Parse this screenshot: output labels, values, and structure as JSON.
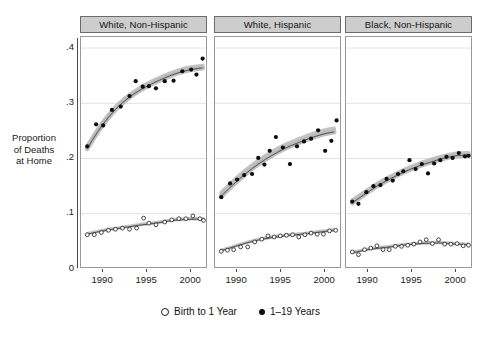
{
  "figure": {
    "ylabel_lines": [
      "Proportion",
      "of Deaths",
      "at Home"
    ],
    "band_color": "#b8b8b8",
    "fit_line_color": "#4d4d4d",
    "filled_marker_color": "#0d0d0d",
    "open_marker_color": "#1a1a1a",
    "gridline_color": "#d9d9d9",
    "strip_background": "#cdcdcd"
  },
  "legend": {
    "position": "bottom",
    "items": [
      {
        "glyph": "open-circle-icon",
        "label": "Birth to 1 Year"
      },
      {
        "glyph": "filled-circle-icon",
        "label": "1–19 Years"
      }
    ]
  },
  "chart_data": {
    "type": "scatter",
    "title": "",
    "subtitle": "",
    "xlabel": "",
    "ylabel": "Proportion of Deaths at Home",
    "xlim": [
      1987.6,
      2001.8
    ],
    "ylim": [
      0,
      0.42
    ],
    "grid": true,
    "yticks": [
      0,
      0.1,
      0.2,
      0.3,
      0.4
    ],
    "ytick_labels": [
      "0",
      ".1",
      ".2",
      ".3",
      ".4"
    ],
    "xticks": [
      1990,
      1995,
      2000
    ],
    "xtick_labels": [
      "1990",
      "1995",
      "2000"
    ],
    "panels": [
      {
        "label": "White, Non-Hispanic",
        "series": [
          {
            "name": "1–19 Years",
            "marker": "filled-circle",
            "x": [
              1988.2,
              1989.2,
              1990.0,
              1991.0,
              1992.0,
              1993.0,
              1993.7,
              1994.5,
              1995.2,
              1996.0,
              1997.0,
              1998.0,
              1999.0,
              2000.0,
              2000.6,
              2001.3
            ],
            "values": [
              0.222,
              0.262,
              0.26,
              0.288,
              0.294,
              0.313,
              0.34,
              0.33,
              0.331,
              0.327,
              0.34,
              0.341,
              0.358,
              0.361,
              0.352,
              0.381
            ],
            "fit": {
              "x": [
                1988.2,
                1989.5,
                1991.0,
                1992.5,
                1994.0,
                1995.5,
                1997.0,
                1998.5,
                2000.0,
                2001.3
              ],
              "y": [
                0.218,
                0.251,
                0.282,
                0.305,
                0.322,
                0.335,
                0.346,
                0.355,
                0.361,
                0.364
              ],
              "band": 0.004
            }
          },
          {
            "name": "Birth to 1 Year",
            "marker": "open-circle",
            "x": [
              1988.2,
              1989.0,
              1989.8,
              1990.6,
              1991.4,
              1992.2,
              1993.0,
              1993.8,
              1994.6,
              1995.2,
              1996.0,
              1997.0,
              1997.8,
              1998.6,
              1999.4,
              2000.2,
              2001.0,
              2001.4
            ],
            "values": [
              0.062,
              0.062,
              0.066,
              0.07,
              0.072,
              0.074,
              0.072,
              0.074,
              0.092,
              0.083,
              0.08,
              0.085,
              0.089,
              0.091,
              0.091,
              0.096,
              0.091,
              0.088
            ],
            "fit": {
              "x": [
                1988.2,
                1990.0,
                1992.0,
                1994.0,
                1996.0,
                1998.0,
                2000.0,
                2001.4
              ],
              "y": [
                0.063,
                0.069,
                0.074,
                0.079,
                0.083,
                0.088,
                0.09,
                0.09
              ],
              "band": 0.002
            }
          }
        ]
      },
      {
        "label": "White, Hispanic",
        "series": [
          {
            "name": "1–19 Years",
            "marker": "filled-circle",
            "x": [
              1988.2,
              1989.2,
              1990.0,
              1990.8,
              1991.7,
              1992.4,
              1993.1,
              1993.7,
              1994.4,
              1995.2,
              1996.0,
              1996.8,
              1997.6,
              1998.4,
              1999.2,
              2000.0,
              2000.7,
              2001.3
            ],
            "values": [
              0.13,
              0.155,
              0.162,
              0.17,
              0.172,
              0.201,
              0.189,
              0.214,
              0.239,
              0.22,
              0.19,
              0.222,
              0.231,
              0.236,
              0.251,
              0.214,
              0.232,
              0.269
            ],
            "fit": {
              "x": [
                1988.2,
                1989.5,
                1991.0,
                1992.5,
                1994.0,
                1995.5,
                1997.0,
                1998.5,
                2000.0,
                2001.0
              ],
              "y": [
                0.132,
                0.152,
                0.173,
                0.191,
                0.206,
                0.219,
                0.229,
                0.238,
                0.245,
                0.248
              ],
              "band": 0.006
            }
          },
          {
            "name": "Birth to 1 Year",
            "marker": "open-circle",
            "x": [
              1988.2,
              1988.9,
              1989.6,
              1990.4,
              1991.2,
              1992.0,
              1992.8,
              1993.5,
              1994.2,
              1994.9,
              1995.6,
              1996.3,
              1997.0,
              1997.7,
              1998.4,
              1999.1,
              1999.8,
              2000.5,
              2001.2
            ],
            "values": [
              0.032,
              0.034,
              0.035,
              0.04,
              0.04,
              0.049,
              0.054,
              0.06,
              0.058,
              0.06,
              0.061,
              0.062,
              0.058,
              0.062,
              0.065,
              0.063,
              0.063,
              0.069,
              0.07
            ],
            "fit": {
              "x": [
                1988.2,
                1990.0,
                1992.0,
                1994.0,
                1996.0,
                1998.0,
                2000.0,
                2001.2
              ],
              "y": [
                0.033,
                0.042,
                0.051,
                0.057,
                0.061,
                0.064,
                0.068,
                0.07
              ],
              "band": 0.002
            }
          }
        ]
      },
      {
        "label": "Black, Non-Hispanic",
        "series": [
          {
            "name": "1–19 Years",
            "marker": "filled-circle",
            "x": [
              1988.2,
              1988.9,
              1989.8,
              1990.6,
              1991.4,
              1992.1,
              1992.8,
              1993.4,
              1994.0,
              1994.7,
              1995.4,
              1996.1,
              1996.8,
              1997.5,
              1998.2,
              1998.9,
              1999.6,
              2000.3,
              2001.0,
              2001.4
            ],
            "values": [
              0.122,
              0.118,
              0.139,
              0.15,
              0.152,
              0.163,
              0.16,
              0.172,
              0.177,
              0.197,
              0.181,
              0.19,
              0.173,
              0.191,
              0.197,
              0.203,
              0.201,
              0.21,
              0.204,
              0.205
            ],
            "fit": {
              "x": [
                1988.2,
                1989.5,
                1991.0,
                1992.5,
                1994.0,
                1995.5,
                1997.0,
                1998.5,
                2000.0,
                2001.4
              ],
              "y": [
                0.12,
                0.134,
                0.15,
                0.163,
                0.175,
                0.185,
                0.193,
                0.2,
                0.205,
                0.206
              ],
              "band": 0.004
            }
          },
          {
            "name": "Birth to 1 Year",
            "marker": "open-circle",
            "x": [
              1988.2,
              1988.9,
              1989.6,
              1990.3,
              1991.0,
              1991.7,
              1992.4,
              1993.1,
              1993.8,
              1994.5,
              1995.2,
              1995.9,
              1996.6,
              1997.3,
              1998.0,
              1998.7,
              1999.4,
              2000.1,
              2000.8,
              2001.4
            ],
            "values": [
              0.031,
              0.026,
              0.035,
              0.038,
              0.042,
              0.035,
              0.035,
              0.041,
              0.041,
              0.043,
              0.045,
              0.049,
              0.053,
              0.046,
              0.053,
              0.045,
              0.045,
              0.046,
              0.042,
              0.043
            ],
            "fit": {
              "x": [
                1988.2,
                1990.0,
                1992.0,
                1994.0,
                1996.0,
                1998.0,
                2000.0,
                2001.4
              ],
              "y": [
                0.029,
                0.035,
                0.039,
                0.043,
                0.046,
                0.047,
                0.045,
                0.044
              ],
              "band": 0.002
            }
          }
        ]
      }
    ]
  }
}
